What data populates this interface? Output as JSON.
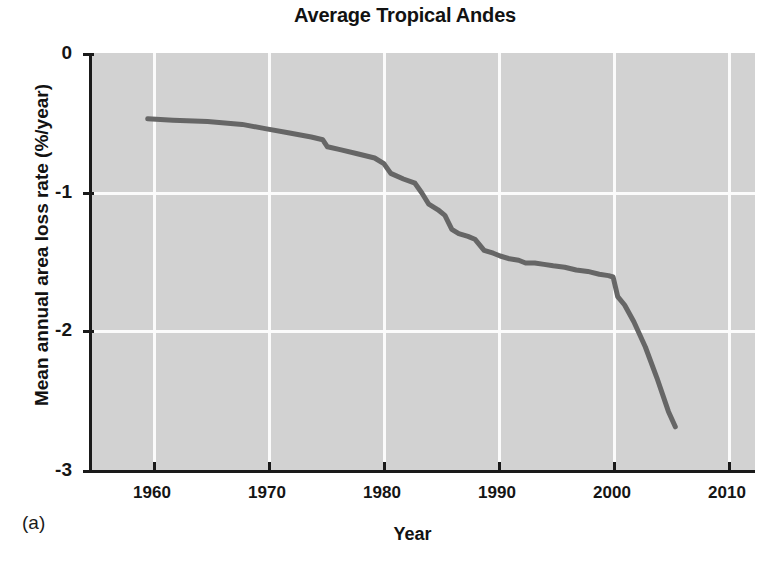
{
  "figure": {
    "panel_label": "(a)",
    "title": "Average Tropical Andes"
  },
  "axes": {
    "xlabel": "Year",
    "ylabel": "Mean annual area loss rate (%/year)",
    "xticks": [
      "1960",
      "1970",
      "1980",
      "1990",
      "2000",
      "2010"
    ],
    "yticks": [
      "0",
      "-1",
      "-2",
      "-3"
    ],
    "plot_background": "#d2d2d2",
    "grid_color": "#fbfbfb",
    "axis_color": "#1a1a1a"
  },
  "chart_data": {
    "type": "line",
    "title": "Average Tropical Andes",
    "xlabel": "Year",
    "ylabel": "Mean annual area loss rate (%/year)",
    "xlim": [
      1955,
      2013
    ],
    "ylim": [
      -3,
      0
    ],
    "xticks": [
      1960,
      1970,
      1980,
      1990,
      2000,
      2010
    ],
    "yticks": [
      0,
      -1,
      -2,
      -3
    ],
    "grid": true,
    "legend": "none",
    "line_color": "#666666",
    "line_width": 5,
    "series": [
      {
        "name": "Mean annual area loss rate",
        "x": [
          1959.8,
          1962.0,
          1965.0,
          1968.0,
          1970.0,
          1972.0,
          1974.0,
          1975.0,
          1975.4,
          1976.5,
          1978.0,
          1979.5,
          1980.3,
          1980.9,
          1982.0,
          1983.0,
          1983.6,
          1984.2,
          1985.0,
          1985.6,
          1986.2,
          1986.8,
          1987.6,
          1988.2,
          1989.0,
          1989.8,
          1990.4,
          1991.2,
          1992.0,
          1992.6,
          1993.4,
          1994.2,
          1995.0,
          1996.0,
          1997.0,
          1998.0,
          1999.0,
          1999.8,
          2000.2,
          2000.6,
          2001.2,
          2002.0,
          2003.0,
          2004.0,
          2005.0,
          2005.6
        ],
        "y": [
          -0.47,
          -0.48,
          -0.49,
          -0.51,
          -0.54,
          -0.57,
          -0.6,
          -0.62,
          -0.67,
          -0.69,
          -0.72,
          -0.75,
          -0.79,
          -0.86,
          -0.9,
          -0.93,
          -1.0,
          -1.08,
          -1.12,
          -1.16,
          -1.26,
          -1.29,
          -1.31,
          -1.33,
          -1.41,
          -1.43,
          -1.45,
          -1.47,
          -1.48,
          -1.5,
          -1.5,
          -1.51,
          -1.52,
          -1.53,
          -1.55,
          -1.56,
          -1.58,
          -1.59,
          -1.6,
          -1.74,
          -1.8,
          -1.92,
          -2.1,
          -2.32,
          -2.56,
          -2.67
        ]
      }
    ]
  }
}
